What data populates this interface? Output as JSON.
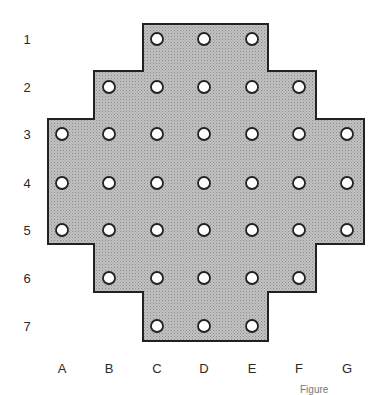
{
  "diagram": {
    "type": "peg-solitaire-board",
    "row_labels": [
      "1",
      "2",
      "3",
      "4",
      "5",
      "6",
      "7"
    ],
    "column_labels": [
      "A",
      "B",
      "C",
      "D",
      "E",
      "F",
      "G"
    ],
    "colors": {
      "board_fill": "#b3b3b3",
      "board_stroke": "#222222",
      "hole_fill": "#ffffff",
      "hole_stroke": "#222222"
    },
    "holes": [
      [
        "C1",
        "D1",
        "E1"
      ],
      [
        "B2",
        "C2",
        "D2",
        "E2",
        "F2"
      ],
      [
        "A3",
        "B3",
        "C3",
        "D3",
        "E3",
        "F3",
        "G3"
      ],
      [
        "A4",
        "B4",
        "C4",
        "D4",
        "E4",
        "F4",
        "G4"
      ],
      [
        "A5",
        "B5",
        "C5",
        "D5",
        "E5",
        "F5",
        "G5"
      ],
      [
        "B6",
        "C6",
        "D6",
        "E6",
        "F6"
      ],
      [
        "C7",
        "D7",
        "E7"
      ]
    ],
    "caption": "Figure"
  }
}
